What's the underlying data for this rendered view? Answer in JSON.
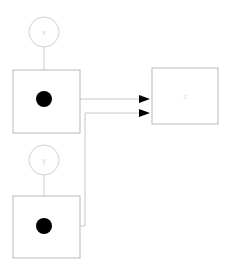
{
  "diagram": {
    "background_color": "#ffffff",
    "nodes": {
      "input_x": {
        "label": "x",
        "shape": "circle",
        "cx": 44,
        "cy": 32,
        "r": 15,
        "stroke_color": "#d2d2d2",
        "label_color": "#d8d8d8"
      },
      "input_y": {
        "label": "y",
        "shape": "circle",
        "cx": 44,
        "cy": 160,
        "r": 15,
        "stroke_color": "#d2d2d2",
        "label_color": "#d8d8d8"
      },
      "block_top": {
        "label": "",
        "shape": "rect",
        "x": 13,
        "y": 70,
        "width": 67,
        "height": 63,
        "stroke_color": "#b9b9b9"
      },
      "block_bottom": {
        "label": "",
        "shape": "rect",
        "x": 13,
        "y": 196,
        "width": 67,
        "height": 62,
        "stroke_color": "#b9b9b9"
      },
      "block_output": {
        "label": "s",
        "shape": "rect",
        "x": 152,
        "y": 68,
        "width": 66,
        "height": 56,
        "stroke_color": "#b9b9b9",
        "label_color": "#e4e4e4"
      }
    },
    "ports": [
      {
        "name": "port-top",
        "cx": 44,
        "cy": 99,
        "r": 8,
        "color": "#000000"
      },
      {
        "name": "port-bottom",
        "cx": 44,
        "cy": 226,
        "r": 8,
        "color": "#000000"
      }
    ],
    "stems": [
      {
        "name": "stem-x-to-block-top",
        "path": "M 44 47 L 44 70"
      },
      {
        "name": "stem-y-to-block-bottom",
        "path": "M 44 175 L 44 196"
      }
    ],
    "wires": [
      {
        "name": "wire-top-port-to-output",
        "path": "M 44 99 L 140 99",
        "color": "#c8c8c8"
      },
      {
        "name": "wire-bottom-port-to-output",
        "path": "M 44 226 L 85 226 L 85 113 L 140 113",
        "color": "#c8c8c8"
      }
    ],
    "arrows": [
      {
        "name": "arrow-into-output-upper",
        "tip_x": 150,
        "y": 99,
        "color": "#000000"
      },
      {
        "name": "arrow-into-output-lower",
        "tip_x": 150,
        "y": 113,
        "color": "#000000"
      }
    ]
  }
}
